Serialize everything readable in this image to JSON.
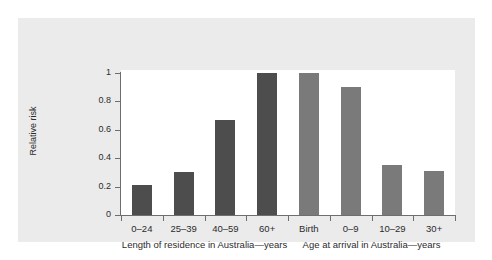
{
  "figure": {
    "background_color": "#ffffff",
    "panel_color": "#ebebeb",
    "plot_background_color": "#ffffff",
    "axis_color": "#6e6e6e"
  },
  "chart_data": {
    "type": "bar",
    "title": "",
    "subtitle": "",
    "xlabel": "",
    "ylabel": "Relative risk",
    "ylim": [
      0,
      1.05
    ],
    "grid": false,
    "legend": null,
    "categories": [
      "0–24",
      "25–39",
      "40–59",
      "60+",
      "Birth",
      "0–9",
      "10–29",
      "30+"
    ],
    "values": [
      0.21,
      0.305,
      0.67,
      1.0,
      1.0,
      0.9,
      0.35,
      0.31
    ],
    "bar_colors": [
      "#4d4d4d",
      "#4d4d4d",
      "#4d4d4d",
      "#4d4d4d",
      "#7a7a7a",
      "#7a7a7a",
      "#7a7a7a",
      "#7a7a7a"
    ],
    "y_ticks": [
      "0",
      "0.2",
      "0.4",
      "0.6",
      "0.8",
      "1"
    ],
    "y_tick_values": [
      0,
      0.2,
      0.4,
      0.6,
      0.8,
      1
    ],
    "groups": [
      {
        "label": "Length of residence in Australia—years",
        "color": "#4d4d4d",
        "categories": [
          "0–24",
          "25–39",
          "40–59",
          "60+"
        ],
        "values": [
          0.21,
          0.305,
          0.67,
          1.0
        ]
      },
      {
        "label": "Age at arrival in Australia—years",
        "color": "#7a7a7a",
        "categories": [
          "Birth",
          "0–9",
          "10–29",
          "30+"
        ],
        "values": [
          1.0,
          0.9,
          0.35,
          0.31
        ]
      }
    ]
  }
}
